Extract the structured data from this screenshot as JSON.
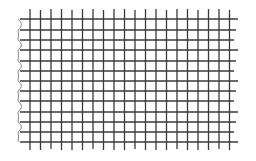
{
  "diagram": {
    "type": "grid-sketch",
    "line_color": "#3a3a3a",
    "edge_color": "#8a8a8a",
    "background": "#ffffff",
    "vertical_lines_x": [
      30,
      40.5,
      51,
      61.5,
      72,
      82.5,
      93,
      103.5,
      114,
      124.5,
      135,
      145.5,
      156,
      166.5,
      177,
      187.5,
      198,
      208.5,
      219,
      229.5
    ],
    "vertical_top": 9,
    "vertical_bottom": 150,
    "horizontal_lines_y": [
      19,
      30,
      40,
      50,
      61,
      71,
      81,
      91,
      101,
      112,
      122,
      132,
      142
    ],
    "horizontal_left": 20,
    "horizontal_right": 238
  }
}
